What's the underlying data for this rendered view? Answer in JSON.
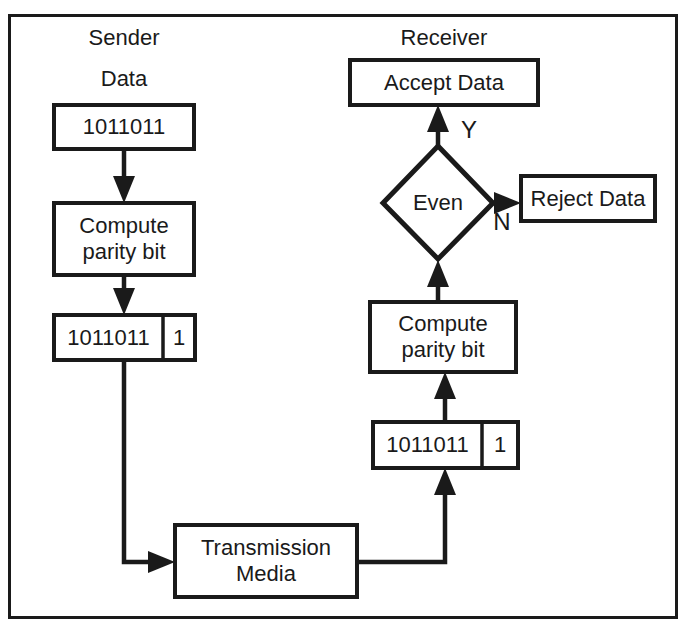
{
  "diagram": {
    "title_labels": {
      "sender": "Sender",
      "sender_data": "Data",
      "receiver": "Receiver"
    },
    "colors": {
      "stroke": "#1a1a1a",
      "fill": "#ffffff",
      "background": "#ffffff"
    },
    "nodes": {
      "sender_data_box": "1011011",
      "sender_compute": "Compute\nparity bit",
      "sender_frame_data": "1011011",
      "sender_frame_parity": "1",
      "transmission_media": "Transmission\nMedia",
      "receiver_frame_data": "1011011",
      "receiver_frame_parity": "1",
      "receiver_compute": "Compute\nparity bit",
      "decision": "Even",
      "accept": "Accept Data",
      "reject": "Reject Data"
    },
    "edge_labels": {
      "yes": "Y",
      "no": "N"
    }
  }
}
